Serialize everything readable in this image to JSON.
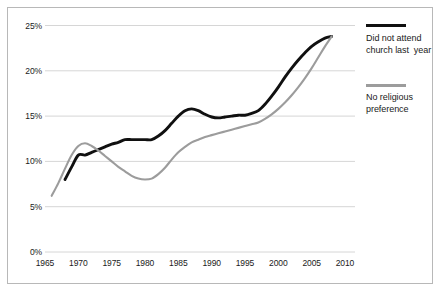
{
  "figure": {
    "border_color": "#b8b8b8",
    "background": "#ffffff"
  },
  "axes": {
    "y_ticks": [
      "25%",
      "20%",
      "15%",
      "10%",
      "5%",
      "0%"
    ],
    "x_ticks": [
      "1965",
      "1970",
      "1975",
      "1980",
      "1985",
      "1990",
      "1995",
      "2000",
      "2005",
      "2010"
    ],
    "gridline_color": "#d6d6d6"
  },
  "legend": {
    "position": "right",
    "entries": [
      {
        "label": "Did not attend\nchurch last  year",
        "color": "#101010",
        "name": "did-not-attend-church"
      },
      {
        "label": "No religious\npreference",
        "color": "#9c9c9c",
        "name": "no-religious-preference"
      }
    ]
  },
  "chart_data": {
    "type": "line",
    "title": "",
    "xlabel": "",
    "ylabel": "",
    "xlim": [
      1965,
      2010
    ],
    "ylim": [
      0,
      25
    ],
    "y_tick_values": [
      0,
      5,
      10,
      15,
      20,
      25
    ],
    "y_tick_labels": [
      "0%",
      "5%",
      "10%",
      "15%",
      "20%",
      "25%"
    ],
    "x_tick_values": [
      1965,
      1970,
      1975,
      1980,
      1985,
      1990,
      1995,
      2000,
      2005,
      2010
    ],
    "grid": "horizontal",
    "legend_position": "right",
    "series": [
      {
        "name": "Did not attend church last  year",
        "color": "#101010",
        "x": [
          1968,
          1969,
          1970,
          1971,
          1972,
          1973,
          1974,
          1975,
          1976,
          1977,
          1978,
          1979,
          1980,
          1981,
          1982,
          1983,
          1984,
          1985,
          1986,
          1987,
          1988,
          1989,
          1990,
          1991,
          1992,
          1993,
          1994,
          1995,
          1996,
          1997,
          1998,
          1999,
          2000,
          2001,
          2002,
          2003,
          2004,
          2005,
          2006,
          2007,
          2008
        ],
        "values": [
          8.0,
          9.4,
          10.7,
          10.7,
          11.0,
          11.3,
          11.6,
          11.9,
          12.1,
          12.4,
          12.4,
          12.4,
          12.4,
          12.4,
          12.8,
          13.4,
          14.2,
          15.0,
          15.6,
          15.8,
          15.6,
          15.2,
          14.9,
          14.8,
          14.9,
          15.0,
          15.1,
          15.1,
          15.3,
          15.6,
          16.3,
          17.2,
          18.2,
          19.3,
          20.3,
          21.2,
          22.0,
          22.7,
          23.2,
          23.6,
          23.8
        ]
      },
      {
        "name": "No religious preference",
        "color": "#9c9c9c",
        "x": [
          1966,
          1967,
          1968,
          1969,
          1970,
          1971,
          1972,
          1973,
          1974,
          1975,
          1976,
          1977,
          1978,
          1979,
          1980,
          1981,
          1982,
          1983,
          1984,
          1985,
          1986,
          1987,
          1988,
          1989,
          1990,
          1991,
          1992,
          1993,
          1994,
          1995,
          1996,
          1997,
          1998,
          1999,
          2000,
          2001,
          2002,
          2003,
          2004,
          2005,
          2006,
          2007,
          2008
        ],
        "values": [
          6.2,
          7.6,
          9.2,
          10.7,
          11.7,
          12.0,
          11.7,
          11.2,
          10.6,
          10.0,
          9.4,
          8.9,
          8.4,
          8.1,
          8.0,
          8.1,
          8.6,
          9.3,
          10.2,
          11.0,
          11.6,
          12.1,
          12.4,
          12.7,
          12.9,
          13.1,
          13.3,
          13.5,
          13.7,
          13.9,
          14.1,
          14.3,
          14.7,
          15.2,
          15.8,
          16.5,
          17.3,
          18.2,
          19.2,
          20.3,
          21.5,
          22.7,
          23.8
        ]
      }
    ]
  }
}
